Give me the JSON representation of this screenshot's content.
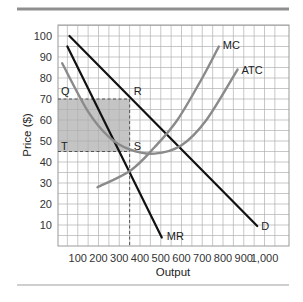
{
  "chart_data": {
    "type": "line",
    "title": "",
    "xlabel": "Output",
    "ylabel": "Price ($)",
    "xlim": [
      0,
      1050
    ],
    "ylim": [
      0,
      105
    ],
    "grid": true,
    "x_ticks": [
      100,
      200,
      300,
      400,
      500,
      600,
      700,
      800,
      900,
      1000
    ],
    "x_tick_labels": [
      "100",
      "200",
      "300",
      "400",
      "500",
      "600",
      "700",
      "800",
      "900",
      "1,000"
    ],
    "y_ticks": [
      10,
      20,
      30,
      40,
      50,
      60,
      70,
      80,
      90,
      100
    ],
    "y_tick_labels": [
      "10",
      "20",
      "30",
      "40",
      "50",
      "60",
      "70",
      "80",
      "90",
      "100"
    ],
    "series": [
      {
        "name": "D",
        "style": "straight",
        "color": "#111111",
        "points": [
          [
            60,
            100
          ],
          [
            965,
            9.5
          ]
        ]
      },
      {
        "name": "MR",
        "style": "straight",
        "color": "#111111",
        "points": [
          [
            50,
            95
          ],
          [
            505,
            4
          ]
        ]
      },
      {
        "name": "MC",
        "style": "curve",
        "color": "#8a8a8a",
        "points": [
          [
            195,
            28
          ],
          [
            355,
            36
          ],
          [
            470,
            47
          ],
          [
            580,
            60
          ],
          [
            700,
            80
          ],
          [
            780,
            95
          ]
        ]
      },
      {
        "name": "ATC",
        "style": "curve",
        "color": "#8a8a8a",
        "points": [
          [
            25,
            87
          ],
          [
            150,
            64
          ],
          [
            250,
            52
          ],
          [
            350,
            46
          ],
          [
            470,
            44
          ],
          [
            600,
            48
          ],
          [
            720,
            60
          ],
          [
            870,
            84
          ]
        ]
      }
    ],
    "annotations": [
      {
        "label": "Q",
        "x": 0,
        "y": 70
      },
      {
        "label": "R",
        "x": 350,
        "y": 70
      },
      {
        "label": "S",
        "x": 350,
        "y": 45
      },
      {
        "label": "T",
        "x": 0,
        "y": 45
      }
    ],
    "shaded_region": {
      "x0": 0,
      "x1": 350,
      "y0": 45,
      "y1": 70,
      "color": "#bdbdbd"
    },
    "dashed_lines": [
      {
        "from": [
          0,
          70
        ],
        "to": [
          350,
          70
        ]
      },
      {
        "from": [
          0,
          45
        ],
        "to": [
          350,
          45
        ]
      },
      {
        "from": [
          350,
          70
        ],
        "to": [
          350,
          0
        ]
      }
    ],
    "profit_max_output": 350,
    "profit_max_price": 70,
    "atc_at_profit_max": 45
  },
  "colors": {
    "grid": "#b0b0b0",
    "frame": "#9a9a9a",
    "rule": "#8f8f8f",
    "shade": "#c4c4c4",
    "dark_line": "#111111",
    "gray_curve": "#8c8c8c"
  }
}
